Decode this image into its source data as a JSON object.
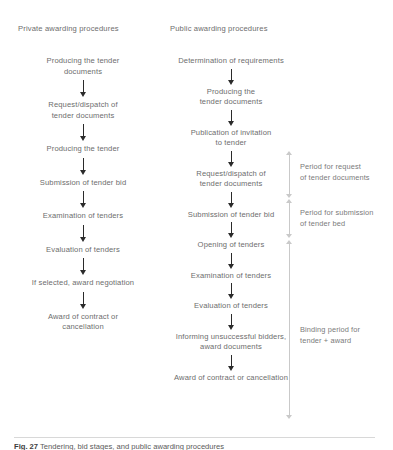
{
  "figure": {
    "columns": [
      {
        "key": "private",
        "heading": "Private awarding procedures",
        "nodes": [
          "Producing the tender\ndocuments",
          "Request/dispatch of\ntender documents",
          "Producing the tender",
          "Submission of tender bid",
          "Examination of tenders",
          "Evaluation of tenders",
          "If selected, award negotiation",
          "Award of contract or\ncancellation"
        ]
      },
      {
        "key": "public",
        "heading": "Public awarding procedures",
        "nodes": [
          "Determination of requirements",
          "Producing the\ntender documents",
          "Publication of invitation\nto tender",
          "Request/dispatch of\ntender documents",
          "Submission of tender bid",
          "Opening of tenders",
          "Examination of tenders",
          "Evaluation of tenders",
          "Informing unsuccessful bidders,\naward documents",
          "Award of contract or cancellation"
        ]
      }
    ],
    "brackets": [
      {
        "key": "request-period",
        "label": "Period for request\nof tender documents"
      },
      {
        "key": "submission-period",
        "label": "Period for submission\nof tender bed"
      },
      {
        "key": "binding-period",
        "label": "Binding period for\ntender + award"
      }
    ],
    "caption": {
      "lead": "Fig. 27",
      "text": "Tendering, bid stages, and public awarding procedures"
    }
  }
}
